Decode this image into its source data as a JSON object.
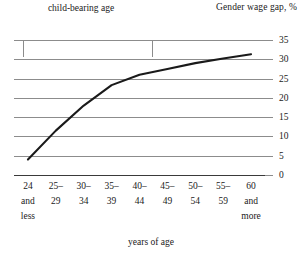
{
  "chart_data": {
    "type": "line",
    "title": "",
    "ylabel": "Gender wage gap, %",
    "xlabel": "years of age",
    "ylim": [
      0,
      35
    ],
    "ytick_values": [
      35,
      30,
      25,
      20,
      15,
      10,
      5,
      0
    ],
    "ytick_labels": [
      "35",
      "30",
      "25",
      "20",
      "15",
      "10",
      "5",
      "0"
    ],
    "grid": true,
    "legend": "none",
    "categories": [
      "24 and less",
      "25–29",
      "30–34",
      "35–39",
      "40–44",
      "45–49",
      "50–54",
      "55–59",
      "60 and more"
    ],
    "category_lines": [
      [
        "24",
        "and",
        "less"
      ],
      [
        "25–",
        "29"
      ],
      [
        "30–",
        "34"
      ],
      [
        "35–",
        "39"
      ],
      [
        "40–",
        "44"
      ],
      [
        "45–",
        "49"
      ],
      [
        "50–",
        "54"
      ],
      [
        "55–",
        "59"
      ],
      [
        "60",
        "and",
        "more"
      ]
    ],
    "values": [
      4,
      11.5,
      18,
      23.3,
      26,
      27.5,
      29,
      30.2,
      31.3
    ],
    "series_color": "#1a1a1a",
    "grid_color": "#8c8c8c",
    "annotations": [
      {
        "label": "child-bearing age",
        "type": "bracket",
        "from_category": "25–29",
        "to_category": "40–44"
      }
    ]
  }
}
